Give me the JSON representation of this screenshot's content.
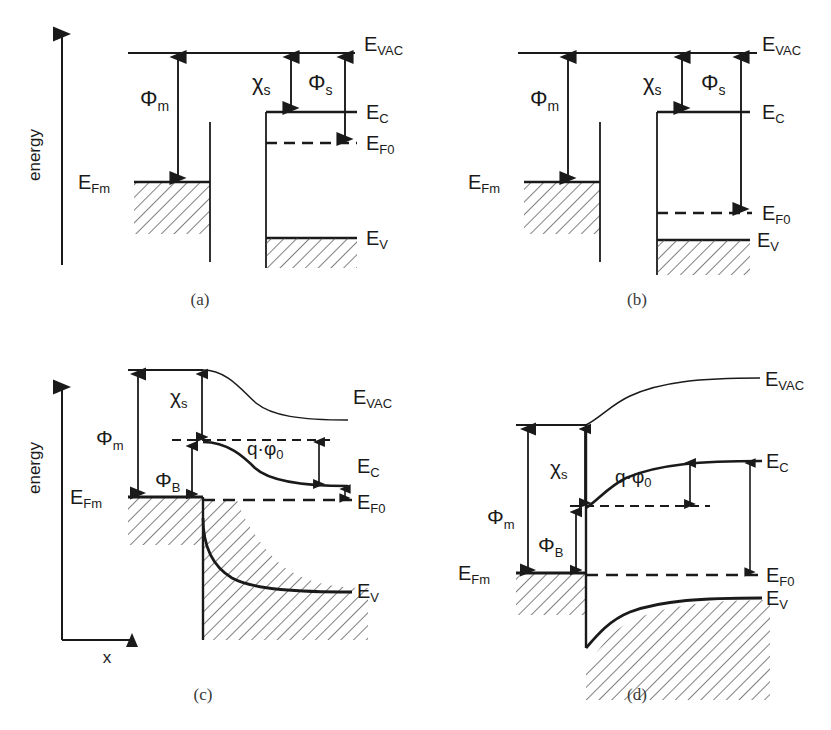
{
  "figure": {
    "type": "energy-band-diagram-set",
    "background": "#ffffff",
    "line_color": "#1a1a1a",
    "caption_color": "#3a3a3a"
  },
  "symbols": {
    "phi_m": "Φ",
    "phi_m_sub": "m",
    "phi_s": "Φ",
    "phi_s_sub": "s",
    "phi_b": "Φ",
    "phi_b_sub": "B",
    "chi": "χ",
    "chi_sub": "s",
    "q_phi0": "q·φ",
    "q_phi0_sub": "0",
    "E": "E",
    "e_vac_sub": "VAC",
    "e_c_sub": "C",
    "e_v_sub": "V",
    "e_f0_sub": "F0",
    "e_fm_sub": "Fm"
  },
  "axes": {
    "energy_label": "energy",
    "x_label": "x"
  },
  "panels": [
    {
      "id": "a",
      "caption": "(a)",
      "kind": "isolated-metal-and-n-type-semiconductor",
      "has_energy_axis": true,
      "has_x_axis": false,
      "levels": {
        "E_VAC": "E_VAC",
        "E_C": "E_C",
        "E_F0": "E_F0",
        "E_V": "E_V",
        "E_Fm": "E_Fm"
      },
      "arrows": [
        {
          "name": "phi_m",
          "label": "Φ",
          "sub": "m",
          "from": "E_VAC",
          "to": "E_Fm"
        },
        {
          "name": "chi_s",
          "label": "χ",
          "sub": "s",
          "from": "E_VAC",
          "to": "E_C"
        },
        {
          "name": "phi_s",
          "label": "Φ",
          "sub": "s",
          "from": "E_VAC",
          "to": "E_F0"
        }
      ]
    },
    {
      "id": "b",
      "caption": "(b)",
      "kind": "isolated-metal-and-p-type-semiconductor",
      "has_energy_axis": false,
      "has_x_axis": false,
      "levels": {
        "E_VAC": "E_VAC",
        "E_C": "E_C",
        "E_F0": "E_F0",
        "E_V": "E_V",
        "E_Fm": "E_Fm"
      },
      "arrows": [
        {
          "name": "phi_m",
          "label": "Φ",
          "sub": "m",
          "from": "E_VAC",
          "to": "E_Fm"
        },
        {
          "name": "chi_s",
          "label": "χ",
          "sub": "s",
          "from": "E_VAC",
          "to": "E_C"
        },
        {
          "name": "phi_s",
          "label": "Φ",
          "sub": "s",
          "from": "E_VAC",
          "to": "E_F0"
        }
      ]
    },
    {
      "id": "c",
      "caption": "(c)",
      "kind": "contacted-junction-downward-band-bending",
      "has_energy_axis": true,
      "has_x_axis": true,
      "levels": {
        "E_VAC": "E_VAC",
        "E_C": "E_C",
        "E_F0": "E_F0",
        "E_V": "E_V",
        "E_Fm": "E_Fm"
      },
      "arrows": [
        {
          "name": "phi_m",
          "label": "Φ",
          "sub": "m",
          "from": "E_VAC",
          "to": "E_Fm"
        },
        {
          "name": "chi_s",
          "label": "χ",
          "sub": "s",
          "from": "E_VAC_interface",
          "to": "E_C_interface"
        },
        {
          "name": "phi_b",
          "label": "Φ",
          "sub": "B",
          "from": "E_C_interface",
          "to": "E_Fm"
        },
        {
          "name": "q_phi0",
          "label": "q·φ",
          "sub": "0",
          "from": "E_C_interface_level",
          "to": "E_C_bulk"
        }
      ]
    },
    {
      "id": "d",
      "caption": "(d)",
      "kind": "contacted-junction-upward-band-bending",
      "has_energy_axis": false,
      "has_x_axis": false,
      "levels": {
        "E_VAC": "E_VAC",
        "E_C": "E_C",
        "E_F0": "E_F0",
        "E_V": "E_V",
        "E_Fm": "E_Fm"
      },
      "arrows": [
        {
          "name": "phi_m",
          "label": "Φ",
          "sub": "m",
          "from": "E_VAC",
          "to": "E_Fm"
        },
        {
          "name": "chi_s",
          "label": "χ",
          "sub": "s",
          "from": "E_VAC_interface",
          "to": "E_C_interface"
        },
        {
          "name": "phi_b",
          "label": "Φ",
          "sub": "B",
          "from": "E_C_interface",
          "to": "E_Fm"
        },
        {
          "name": "q_phi0",
          "label": "q·φ",
          "sub": "0",
          "from": "E_C_bulk",
          "to": "E_C_interface_level"
        }
      ]
    }
  ]
}
